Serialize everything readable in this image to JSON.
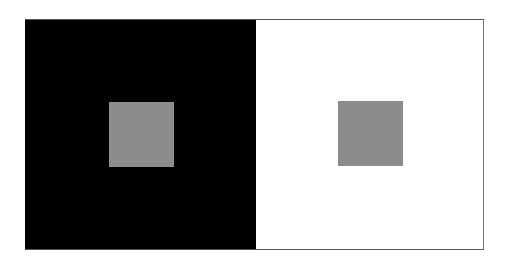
{
  "figure": {
    "panels": [
      {
        "id": "left",
        "background_color": "#000000",
        "square_color": "#8c8c8c"
      },
      {
        "id": "right",
        "background_color": "#ffffff",
        "square_color": "#8c8c8c"
      }
    ],
    "frame_color": "#555555",
    "page_background": "#ffffff"
  }
}
